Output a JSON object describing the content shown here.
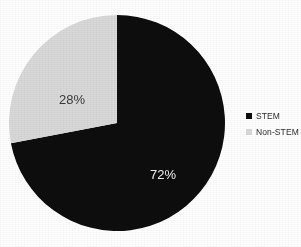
{
  "chart_data": {
    "type": "pie",
    "title": "",
    "subtitle": "",
    "xlabel": "",
    "ylabel": "",
    "categories": [
      "STEM",
      "Non-STEM"
    ],
    "values": [
      72,
      28
    ],
    "value_labels": [
      "72%",
      "28%"
    ],
    "unit": "%",
    "slices": [
      {
        "name": "STEM",
        "value": 72,
        "label": "72%",
        "color": "#0d0d0d",
        "label_color": "#f2f2f2",
        "start_angle_deg": 0,
        "end_angle_deg": 259.2
      },
      {
        "name": "Non-STEM",
        "value": 28,
        "label": "28%",
        "color": "#d9d9d9",
        "label_color": "#3a3a3a",
        "start_angle_deg": 259.2,
        "end_angle_deg": 360
      }
    ],
    "legend": {
      "position": "right",
      "entries": [
        {
          "label": "STEM",
          "color": "#0d0d0d"
        },
        {
          "label": "Non-STEM",
          "color": "#d9d9d9"
        }
      ]
    },
    "grid": false,
    "background": "#ffffff",
    "start_angle_clock": "12 o'clock",
    "direction": "clockwise"
  },
  "figure": {
    "title": "",
    "pie": {
      "center_x": 109,
      "center_y": 111,
      "radius": 108
    }
  },
  "legend": {
    "items": [
      {
        "label": "STEM",
        "color": "#0d0d0d"
      },
      {
        "label": "Non-STEM",
        "color": "#d9d9d9"
      }
    ]
  },
  "labels": {
    "stem": "72%",
    "non_stem": "28%"
  },
  "colors": {
    "stem": "#0d0d0d",
    "non_stem": "#d9d9d9",
    "background": "#ffffff",
    "text": "#2b2b2b"
  }
}
